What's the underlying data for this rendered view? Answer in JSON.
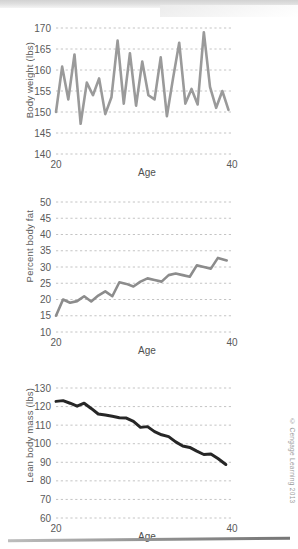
{
  "figure": {
    "copyright": "© Cengage Learning 2013"
  },
  "chart_data": [
    {
      "type": "line",
      "title": "",
      "name": "body-weight-chart",
      "xlabel": "Age",
      "ylabel": "Body weight (lbs)",
      "xlim": [
        20,
        40
      ],
      "ylim": [
        140,
        170
      ],
      "xticks": [
        20,
        40
      ],
      "xticklabels": [
        "20",
        "40"
      ],
      "yticks": [
        140,
        145,
        150,
        155,
        160,
        165,
        170
      ],
      "yticklabels": [
        "140",
        "145",
        "150",
        "155",
        "160",
        "165",
        "170"
      ],
      "grid": true,
      "line_color": "#9a9a9a",
      "x": [
        20.0,
        20.7,
        21.4,
        22.1,
        22.8,
        23.5,
        24.2,
        24.9,
        25.6,
        26.3,
        27.0,
        27.7,
        28.4,
        29.1,
        29.8,
        30.5,
        31.2,
        31.9,
        32.6,
        33.3,
        34.0,
        34.7,
        35.4,
        36.1,
        36.8,
        37.5,
        38.2,
        38.9,
        39.6
      ],
      "values": [
        150.0,
        160.8,
        153.0,
        163.7,
        147.2,
        157.0,
        154.0,
        158.0,
        149.5,
        153.5,
        167.0,
        152.0,
        164.0,
        151.5,
        162.0,
        154.0,
        153.0,
        163.0,
        149.0,
        158.0,
        166.5,
        152.0,
        155.5,
        151.8,
        169.0,
        156.0,
        151.0,
        155.0,
        150.5
      ]
    },
    {
      "type": "line",
      "title": "",
      "name": "percent-body-fat-chart",
      "xlabel": "Age",
      "ylabel": "Percent body fat",
      "xlim": [
        20,
        40
      ],
      "ylim": [
        10,
        50
      ],
      "xticks": [
        20,
        40
      ],
      "xticklabels": [
        "20",
        "40"
      ],
      "yticks": [
        10,
        15,
        20,
        25,
        30,
        35,
        40,
        45,
        50
      ],
      "yticklabels": [
        "10",
        "15",
        "20",
        "25",
        "30",
        "35",
        "40",
        "45",
        "50"
      ],
      "grid": true,
      "line_color": "#8c8c8c",
      "x": [
        20.0,
        20.8,
        21.6,
        22.4,
        23.2,
        24.0,
        24.8,
        25.6,
        26.4,
        27.2,
        28.0,
        28.8,
        29.6,
        30.4,
        31.2,
        32.0,
        32.8,
        33.6,
        34.4,
        35.2,
        36.0,
        36.8,
        37.6,
        38.4,
        39.4
      ],
      "values": [
        15.0,
        20.0,
        19.0,
        19.5,
        21.0,
        19.4,
        21.2,
        22.5,
        21.0,
        25.3,
        24.8,
        24.0,
        25.5,
        26.5,
        26.0,
        25.5,
        27.5,
        28.0,
        27.5,
        27.0,
        30.5,
        30.0,
        29.5,
        32.8,
        32.0
      ]
    },
    {
      "type": "line",
      "title": "",
      "name": "lean-body-mass-chart",
      "xlabel": "Age",
      "ylabel": "Lean body mass (lbs)",
      "xlim": [
        20,
        40
      ],
      "ylim": [
        60,
        130
      ],
      "xticks": [
        20,
        40
      ],
      "xticklabels": [
        "20",
        "40"
      ],
      "yticks": [
        60,
        70,
        80,
        90,
        100,
        110,
        120,
        130
      ],
      "yticklabels": [
        "60",
        "70",
        "80",
        "90",
        "100",
        "110",
        "120",
        "130"
      ],
      "grid": true,
      "line_color": "#262626",
      "x": [
        20.0,
        20.8,
        21.6,
        22.4,
        23.2,
        24.0,
        24.8,
        25.6,
        26.4,
        27.2,
        28.0,
        28.8,
        29.6,
        30.4,
        31.2,
        32.0,
        32.8,
        33.6,
        34.4,
        35.2,
        36.0,
        36.8,
        37.6,
        38.4,
        39.3
      ],
      "values": [
        122.8,
        123.2,
        121.8,
        120.2,
        121.8,
        119.0,
        116.0,
        115.5,
        114.8,
        114.0,
        113.8,
        112.0,
        108.8,
        109.2,
        106.5,
        104.8,
        103.8,
        101.0,
        98.8,
        98.0,
        96.0,
        94.2,
        94.5,
        92.0,
        88.8
      ]
    }
  ]
}
